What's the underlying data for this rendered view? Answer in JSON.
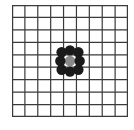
{
  "grid": {
    "columns": 9,
    "rows": 9,
    "line_color": "#3a3a3a",
    "background": "#ffffff"
  },
  "stones": [
    {
      "col": 4,
      "row": 4,
      "color": "#8a8a8a",
      "type": "center"
    },
    {
      "col": 4,
      "row": 3,
      "color": "#1a1a1a",
      "dx": 0,
      "dy": 0.15
    },
    {
      "col": 3,
      "row": 3,
      "color": "#1a1a1a",
      "dx": 0.35,
      "dy": 0.3
    },
    {
      "col": 5,
      "row": 3,
      "color": "#1a1a1a",
      "dx": -0.35,
      "dy": 0.3
    },
    {
      "col": 3,
      "row": 4,
      "color": "#1a1a1a",
      "dx": 0.25,
      "dy": 0
    },
    {
      "col": 5,
      "row": 4,
      "color": "#1a1a1a",
      "dx": -0.25,
      "dy": 0
    },
    {
      "col": 3,
      "row": 5,
      "color": "#1a1a1a",
      "dx": 0.35,
      "dy": -0.3
    },
    {
      "col": 5,
      "row": 5,
      "color": "#1a1a1a",
      "dx": -0.35,
      "dy": -0.3
    },
    {
      "col": 4,
      "row": 5,
      "color": "#1a1a1a",
      "dx": 0,
      "dy": -0.15
    }
  ]
}
